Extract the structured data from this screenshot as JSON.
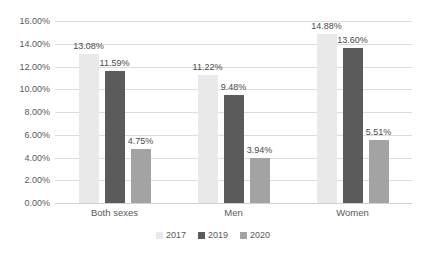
{
  "chart_data": {
    "type": "bar",
    "title": "",
    "subtitle": "",
    "xlabel": "",
    "ylabel": "",
    "categories": [
      "Both sexes",
      "Men",
      "Women"
    ],
    "series": [
      {
        "name": "2017",
        "color": "#e9e9e9",
        "values": [
          13.08,
          11.22,
          14.88
        ],
        "labels": [
          "13.08%",
          "11.22%",
          "14.88%"
        ]
      },
      {
        "name": "2019",
        "color": "#5b5b5b",
        "values": [
          11.59,
          9.48,
          13.6
        ],
        "labels": [
          "11.59%",
          "9.48%",
          "13.60%"
        ]
      },
      {
        "name": "2020",
        "color": "#a3a3a3",
        "values": [
          4.75,
          3.94,
          5.51
        ],
        "labels": [
          "4.75%",
          "3.94%",
          "5.51%"
        ]
      }
    ],
    "ylim": [
      0,
      16
    ],
    "ytick_step": 2,
    "ytick_labels": [
      "0.00%",
      "2.00%",
      "4.00%",
      "6.00%",
      "8.00%",
      "10.00%",
      "12.00%",
      "14.00%",
      "16.00%"
    ],
    "grid": true,
    "grid_axis": "y",
    "legend": true,
    "legend_position": "bottom",
    "data_labels": true,
    "value_suffix": "%"
  }
}
